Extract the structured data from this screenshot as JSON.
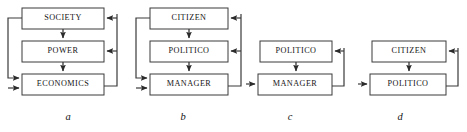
{
  "figure": {
    "width": 467,
    "height": 132,
    "background": "#ffffff",
    "stroke_color": "#3a3a3a",
    "text_color": "#141414",
    "box_fill": "#ffffff"
  },
  "panels": [
    {
      "id": "a",
      "caption": "a",
      "caption_x": 68,
      "caption_y": 112,
      "nodes": [
        {
          "id": "a-society",
          "label": "SOCIETY",
          "x": 22,
          "y": 8,
          "w": 82,
          "h": 21
        },
        {
          "id": "a-power",
          "label": "POWER",
          "x": 22,
          "y": 41,
          "w": 82,
          "h": 21
        },
        {
          "id": "a-economics",
          "label": "ECONOMICS",
          "x": 22,
          "y": 74,
          "w": 82,
          "h": 21
        }
      ],
      "edges": [
        {
          "id": "a-society-to-power",
          "from": "SOCIETY",
          "to": "POWER",
          "kind": "down-arrow"
        },
        {
          "id": "a-power-to-economics",
          "from": "POWER",
          "to": "ECONOMICS",
          "kind": "down-arrow"
        },
        {
          "id": "a-society-to-economics",
          "from": "SOCIETY",
          "to": "ECONOMICS",
          "kind": "left-loop-down"
        },
        {
          "id": "a-economics-to-power",
          "from": "ECONOMICS",
          "to": "POWER",
          "kind": "right-loop-up"
        },
        {
          "id": "a-economics-to-society",
          "from": "ECONOMICS",
          "to": "SOCIETY",
          "kind": "right-loop-up"
        }
      ]
    },
    {
      "id": "b",
      "caption": "b",
      "caption_x": 183,
      "caption_y": 112,
      "nodes": [
        {
          "id": "b-citizen",
          "label": "CITIZEN",
          "x": 150,
          "y": 8,
          "w": 78,
          "h": 21
        },
        {
          "id": "b-politico",
          "label": "POLITICO",
          "x": 150,
          "y": 41,
          "w": 78,
          "h": 21
        },
        {
          "id": "b-manager",
          "label": "MANAGER",
          "x": 150,
          "y": 74,
          "w": 78,
          "h": 21
        }
      ],
      "edges": [
        {
          "id": "b-citizen-to-politico",
          "from": "CITIZEN",
          "to": "POLITICO",
          "kind": "down-arrow"
        },
        {
          "id": "b-politico-to-manager",
          "from": "POLITICO",
          "to": "MANAGER",
          "kind": "down-arrow"
        },
        {
          "id": "b-citizen-to-manager",
          "from": "CITIZEN",
          "to": "MANAGER",
          "kind": "left-loop-down"
        },
        {
          "id": "b-manager-to-politico",
          "from": "MANAGER",
          "to": "POLITICO",
          "kind": "right-loop-up"
        },
        {
          "id": "b-manager-to-citizen",
          "from": "MANAGER",
          "to": "CITIZEN",
          "kind": "right-loop-up"
        }
      ]
    },
    {
      "id": "c",
      "caption": "c",
      "caption_x": 290,
      "caption_y": 112,
      "nodes": [
        {
          "id": "c-politico",
          "label": "POLITICO",
          "x": 260,
          "y": 41,
          "w": 72,
          "h": 21
        },
        {
          "id": "c-manager",
          "label": "MANAGER",
          "x": 258,
          "y": 74,
          "w": 74,
          "h": 21
        }
      ],
      "edges": [
        {
          "id": "c-politico-to-manager",
          "from": "POLITICO",
          "to": "MANAGER",
          "kind": "down-arrow"
        },
        {
          "id": "c-manager-to-politico",
          "from": "MANAGER",
          "to": "POLITICO",
          "kind": "right-loop-up"
        },
        {
          "id": "c-external-to-manager",
          "from": "",
          "to": "MANAGER",
          "kind": "left-stub-arrow"
        }
      ]
    },
    {
      "id": "d",
      "caption": "d",
      "caption_x": 400,
      "caption_y": 112,
      "nodes": [
        {
          "id": "d-citizen",
          "label": "CITIZEN",
          "x": 372,
          "y": 41,
          "w": 74,
          "h": 21
        },
        {
          "id": "d-politico",
          "label": "POLITICO",
          "x": 370,
          "y": 74,
          "w": 76,
          "h": 21
        }
      ],
      "edges": [
        {
          "id": "d-citizen-to-politico",
          "from": "CITIZEN",
          "to": "POLITICO",
          "kind": "down-arrow"
        },
        {
          "id": "d-politico-to-citizen",
          "from": "POLITICO",
          "to": "CITIZEN",
          "kind": "right-loop-up"
        },
        {
          "id": "d-external-to-politico",
          "from": "",
          "to": "POLITICO",
          "kind": "left-stub-arrow"
        }
      ]
    }
  ]
}
